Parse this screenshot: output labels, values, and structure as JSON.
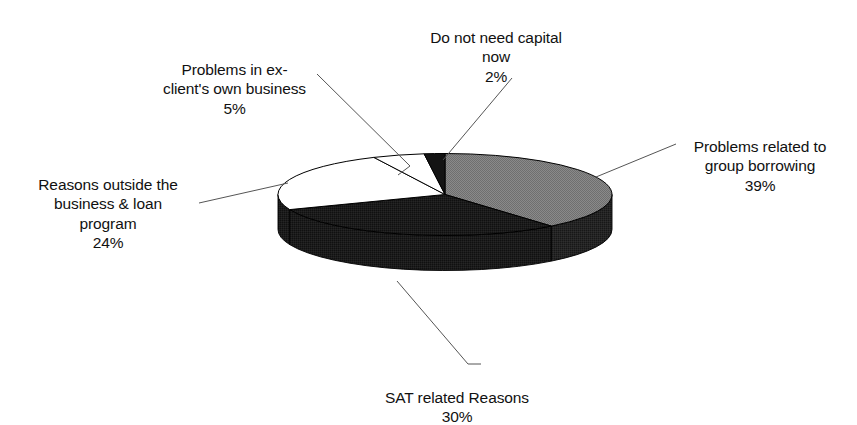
{
  "chart_data": {
    "type": "pie",
    "title": "",
    "subtitle": "",
    "xlabel": "",
    "ylabel": "",
    "legend_position": "none",
    "grid": false,
    "three_d": true,
    "value_suffix": "%",
    "total": 100,
    "categories": [
      "Problems related to group borrowing",
      "SAT related Reasons",
      "Reasons outside the business & loan program",
      "Problems in ex-client's own business",
      "Do not need capital now"
    ],
    "values": [
      39,
      30,
      24,
      5,
      2
    ],
    "slice_colors": [
      "#808080",
      "#1a1a1a",
      "#ffffff",
      "#ffffff",
      "#1a1a1a"
    ],
    "slices": [
      {
        "name": "group-borrowing",
        "label": "Problems related to\ngroup borrowing",
        "percent_text": "39%",
        "value": 39,
        "color": "#808080",
        "side_color": "#1f1f1f"
      },
      {
        "name": "sat-related",
        "label": "SAT related Reasons",
        "percent_text": "30%",
        "value": 30,
        "color": "#1a1a1a",
        "side_color": "#141414"
      },
      {
        "name": "outside-business-loan",
        "label": "Reasons outside the\nbusiness & loan\nprogram",
        "percent_text": "24%",
        "value": 24,
        "color": "#ffffff",
        "side_color": "#1a1a1a"
      },
      {
        "name": "ex-client-business",
        "label": "Problems in ex-\nclient's own business",
        "percent_text": "5%",
        "value": 5,
        "color": "#ffffff",
        "side_color": "#1a1a1a"
      },
      {
        "name": "do-not-need-capital",
        "label": "Do not need capital\nnow",
        "percent_text": "2%",
        "value": 2,
        "color": "#1a1a1a",
        "side_color": "#141414"
      }
    ]
  },
  "labels": {
    "do_not_need_capital": {
      "text": "Do not need capital\nnow",
      "percent": "2%"
    },
    "ex_client_business": {
      "text": "Problems in ex-\nclient's own business",
      "percent": "5%"
    },
    "group_borrowing": {
      "text": "Problems related to\ngroup borrowing",
      "percent": "39%"
    },
    "outside_business": {
      "text": "Reasons outside the\nbusiness & loan\nprogram",
      "percent": "24%"
    },
    "sat_related": {
      "text": "SAT related Reasons",
      "percent": "30%"
    }
  },
  "style": {
    "background": "#ffffff",
    "text_color": "#111111",
    "leader_line_color": "#555555",
    "outline_color": "#000000"
  }
}
